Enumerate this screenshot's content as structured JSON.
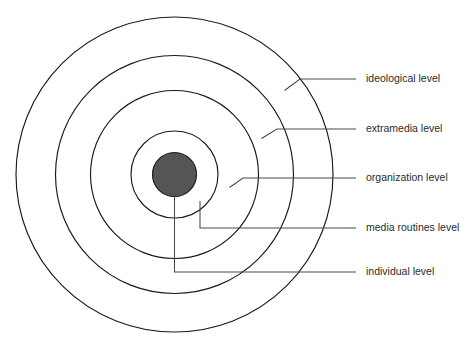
{
  "diagram": {
    "type": "concentric-rings",
    "background_color": "#ffffff",
    "ring_stroke_color": "#1a1a1a",
    "leader_stroke_color": "#4a4a4a",
    "label_text_color": "#2b2b2b",
    "core_fill_color": "#555555",
    "center": {
      "x": 174.5,
      "y": 174.5
    },
    "rings": [
      {
        "id": "ideological",
        "label": "ideological level",
        "rx": 158.5,
        "ry": 157.5,
        "order": 1,
        "filled": false
      },
      {
        "id": "extramedia",
        "label": "extramedia level",
        "rx": 119.0,
        "ry": 119.0,
        "order": 2,
        "filled": false
      },
      {
        "id": "organization",
        "label": "organization level",
        "rx": 84.0,
        "ry": 84.0,
        "order": 3,
        "filled": false
      },
      {
        "id": "media-routines",
        "label": "media routines level",
        "rx": 43.5,
        "ry": 43.5,
        "order": 4,
        "filled": false
      },
      {
        "id": "individual",
        "label": "individual level",
        "rx": 22.0,
        "ry": 22.0,
        "order": 5,
        "filled": true,
        "fill_color": "#555555"
      }
    ],
    "labels": [
      {
        "id": "label-ideological",
        "text": "ideological level",
        "x": 366,
        "y": 79,
        "leader_path": "M 284.5 90.5 L 300 79 L 356 79"
      },
      {
        "id": "label-extramedia",
        "text": "extramedia level",
        "x": 366,
        "y": 129,
        "leader_path": "M 261.5 138.5 L 277 129 L 356 129"
      },
      {
        "id": "label-organization",
        "text": "organization level",
        "x": 366,
        "y": 178,
        "leader_path": "M 229.5 187.5 L 243 178 L 356 178"
      },
      {
        "id": "label-media-routines",
        "text": "media routines level",
        "x": 366,
        "y": 228,
        "leader_path": "M 200 201 L 200 228 L 356 228"
      },
      {
        "id": "label-individual",
        "text": "individual level",
        "x": 366,
        "y": 272,
        "leader_path": "M 174.5 196 L 174.5 272 L 356 272"
      }
    ]
  }
}
